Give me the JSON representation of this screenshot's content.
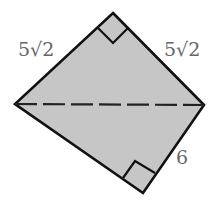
{
  "diagram": {
    "type": "quadrilateral-with-diagonal",
    "vertices": {
      "top": [
        113,
        13
      ],
      "left": [
        15,
        104
      ],
      "right": [
        204,
        105
      ],
      "bottom": [
        143,
        193
      ]
    },
    "fill_color": "#c6c6c6",
    "stroke_color": "#111111",
    "label_color": "#666666",
    "labels": {
      "top_left_side": "5√2",
      "top_right_side": "5√2",
      "bottom_right_side": "6"
    },
    "right_angles": [
      "top",
      "bottom"
    ],
    "diagonal": "dashed from left to right vertex"
  }
}
